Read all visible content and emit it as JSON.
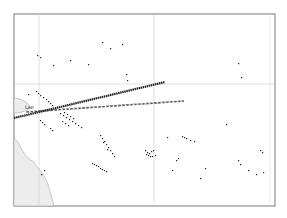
{
  "map": {
    "region": "Southwest Pacific",
    "labels": [
      {
        "name": "place-label-lae",
        "text": "Lae"
      }
    ],
    "routes": [
      {
        "name": "route-solid",
        "style": "solid",
        "color": "#222222"
      },
      {
        "name": "route-dashed",
        "style": "dashed",
        "color": "#555555"
      }
    ],
    "colors": {
      "land": "#ececec",
      "ocean": "#ffffff",
      "frame": "#777777",
      "grid": "#cccccc",
      "islands": "#222222"
    }
  }
}
